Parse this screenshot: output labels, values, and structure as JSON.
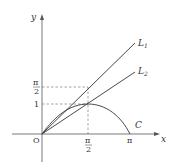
{
  "figure": {
    "axes": {
      "x_label": "x",
      "y_label": "y",
      "origin_label": "O"
    },
    "x_ticks": [
      {
        "label_num": "π",
        "label_den": "2",
        "value": "π/2"
      },
      {
        "label": "π",
        "value": "π"
      }
    ],
    "y_ticks": [
      {
        "label": "1",
        "value": 1
      },
      {
        "label_num": "π",
        "label_den": "2",
        "value": "π/2"
      }
    ],
    "curves": [
      {
        "name": "C",
        "label": "C",
        "description": "y = sin x on [0, π]"
      },
      {
        "name": "L1",
        "label_main": "L",
        "label_sub": "1",
        "description": "line through O and (π/2, π/2)"
      },
      {
        "name": "L2",
        "label_main": "L",
        "label_sub": "2",
        "description": "line through O and (π/2, 1)"
      }
    ],
    "guides": [
      "dashed horizontal at y=π/2",
      "dashed horizontal at y=1",
      "dashed vertical at x=π/2"
    ],
    "colors": {
      "stroke": "#333333",
      "dash": "#555555"
    }
  }
}
